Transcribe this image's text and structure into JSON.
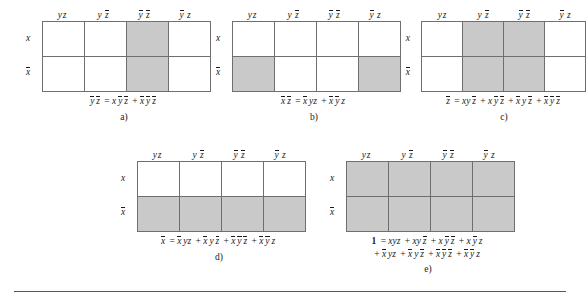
{
  "figure": {
    "kind": "karnaugh-map-set",
    "variables": [
      "x",
      "y",
      "z"
    ],
    "column_headers": [
      "yz",
      "y z̅",
      "y̅ z̅",
      "y̅ z"
    ],
    "row_headers": [
      "x",
      "x̅"
    ],
    "shade_color": "#c9c9c9",
    "border_color": "#6f6f6f"
  },
  "maps": [
    {
      "letter": "a)",
      "name": "map-a",
      "cells": [
        [
          false,
          false,
          true,
          false
        ],
        [
          false,
          false,
          true,
          false
        ]
      ],
      "caption_lines": [
        "y̅ z̅ = x y̅ z̅ + x̅ y̅ z̅"
      ],
      "caption_tokens": [
        [
          {
            "t": "y",
            "bar": true
          },
          {
            "t": "z",
            "bar": true
          },
          {
            "t": " = ",
            "plain": true
          },
          {
            "t": "x",
            "bar": false
          },
          {
            "t": "y",
            "bar": true
          },
          {
            "t": "z",
            "bar": true
          },
          {
            "t": " + ",
            "plain": true
          },
          {
            "t": "x",
            "bar": true
          },
          {
            "t": "y",
            "bar": true
          },
          {
            "t": "z",
            "bar": true
          }
        ]
      ]
    },
    {
      "letter": "b)",
      "name": "map-b",
      "cells": [
        [
          false,
          false,
          false,
          false
        ],
        [
          true,
          false,
          false,
          true
        ]
      ],
      "caption_lines": [
        "x̅ z̅ = x̅ yz + x̅ y̅ z"
      ],
      "caption_tokens": [
        [
          {
            "t": "x",
            "bar": true
          },
          {
            "t": "z",
            "bar": true
          },
          {
            "t": " = ",
            "plain": true
          },
          {
            "t": "x",
            "bar": true
          },
          {
            "t": "yz",
            "bar": false
          },
          {
            "t": " + ",
            "plain": true
          },
          {
            "t": "x",
            "bar": true
          },
          {
            "t": "y",
            "bar": true
          },
          {
            "t": "z",
            "bar": false
          }
        ]
      ]
    },
    {
      "letter": "c)",
      "name": "map-c",
      "cells": [
        [
          false,
          true,
          true,
          false
        ],
        [
          false,
          true,
          true,
          false
        ]
      ],
      "caption_lines": [
        "z̅ = xy z̅ + x y̅ z̅ + x̅ y z̅ + x̅ y̅ z̅"
      ],
      "caption_tokens": [
        [
          {
            "t": "z",
            "bar": true
          },
          {
            "t": " = ",
            "plain": true
          },
          {
            "t": "xy",
            "bar": false
          },
          {
            "t": "z",
            "bar": true
          },
          {
            "t": " + ",
            "plain": true
          },
          {
            "t": "x",
            "bar": false
          },
          {
            "t": "y",
            "bar": true
          },
          {
            "t": "z",
            "bar": true
          },
          {
            "t": " + ",
            "plain": true
          },
          {
            "t": "x",
            "bar": true
          },
          {
            "t": "y",
            "bar": false
          },
          {
            "t": "z",
            "bar": true
          },
          {
            "t": " + ",
            "plain": true
          },
          {
            "t": "x",
            "bar": true
          },
          {
            "t": "y",
            "bar": true
          },
          {
            "t": "z",
            "bar": true
          }
        ]
      ]
    },
    {
      "letter": "d)",
      "name": "map-d",
      "cells": [
        [
          false,
          false,
          false,
          false
        ],
        [
          true,
          true,
          true,
          true
        ]
      ],
      "caption_lines": [
        "x̅ = x̅ yz + x̅ y z̅ + x̅ y̅ z̅ + x̅ y̅ z"
      ],
      "caption_tokens": [
        [
          {
            "t": "x",
            "bar": true
          },
          {
            "t": " = ",
            "plain": true
          },
          {
            "t": "x",
            "bar": true
          },
          {
            "t": "yz",
            "bar": false
          },
          {
            "t": " + ",
            "plain": true
          },
          {
            "t": "x",
            "bar": true
          },
          {
            "t": "y",
            "bar": false
          },
          {
            "t": "z",
            "bar": true
          },
          {
            "t": " + ",
            "plain": true
          },
          {
            "t": "x",
            "bar": true
          },
          {
            "t": "y",
            "bar": true
          },
          {
            "t": "z",
            "bar": true
          },
          {
            "t": " + ",
            "plain": true
          },
          {
            "t": "x",
            "bar": true
          },
          {
            "t": "y",
            "bar": true
          },
          {
            "t": "z",
            "bar": false
          }
        ]
      ]
    },
    {
      "letter": "e)",
      "name": "map-e",
      "cells": [
        [
          true,
          true,
          true,
          true
        ],
        [
          true,
          true,
          true,
          true
        ]
      ],
      "caption_lines": [
        "1 = xyz + xy z̅ + x y̅ z̅ + x y̅ z",
        "+ x̅ yz + x̅ y z̅ + x̅ y̅ z̅ + x̅ y̅ z"
      ],
      "caption_tokens": [
        [
          {
            "t": "1",
            "bold": true
          },
          {
            "t": " = ",
            "plain": true
          },
          {
            "t": "xyz",
            "bar": false
          },
          {
            "t": " + ",
            "plain": true
          },
          {
            "t": "xy",
            "bar": false
          },
          {
            "t": "z",
            "bar": true
          },
          {
            "t": " + ",
            "plain": true
          },
          {
            "t": "x",
            "bar": false
          },
          {
            "t": "y",
            "bar": true
          },
          {
            "t": "z",
            "bar": true
          },
          {
            "t": " + ",
            "plain": true
          },
          {
            "t": "x",
            "bar": false
          },
          {
            "t": "y",
            "bar": true
          },
          {
            "t": "z",
            "bar": false
          }
        ],
        [
          {
            "t": "+ ",
            "plain": true
          },
          {
            "t": "x",
            "bar": true
          },
          {
            "t": "yz",
            "bar": false
          },
          {
            "t": " + ",
            "plain": true
          },
          {
            "t": "x",
            "bar": true
          },
          {
            "t": "y",
            "bar": false
          },
          {
            "t": "z",
            "bar": true
          },
          {
            "t": " + ",
            "plain": true
          },
          {
            "t": "x",
            "bar": true
          },
          {
            "t": "y",
            "bar": true
          },
          {
            "t": "z",
            "bar": true
          },
          {
            "t": " + ",
            "plain": true
          },
          {
            "t": "x",
            "bar": true
          },
          {
            "t": "y",
            "bar": true
          },
          {
            "t": "z",
            "bar": false
          }
        ]
      ]
    }
  ]
}
